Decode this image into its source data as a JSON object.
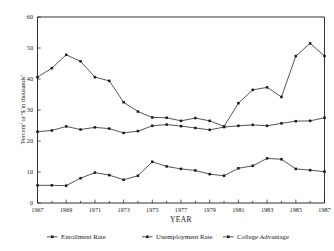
{
  "chart_data": {
    "type": "line",
    "title": "",
    "xlabel": "YEAR",
    "ylabel": "'Percent' or '$ in thousands'",
    "xlim": [
      1967,
      1987
    ],
    "ylim": [
      0,
      60
    ],
    "grid": false,
    "legend_position": "bottom",
    "x": [
      1967,
      1968,
      1969,
      1970,
      1971,
      1972,
      1973,
      1974,
      1975,
      1976,
      1977,
      1978,
      1979,
      1980,
      1981,
      1982,
      1983,
      1984,
      1985,
      1986,
      1987
    ],
    "xtick_labels": [
      "1967",
      "1969",
      "1971",
      "1973",
      "1975",
      "1977",
      "1979",
      "1981",
      "1983",
      "1985",
      "1987"
    ],
    "xtick_values": [
      1967,
      1969,
      1971,
      1973,
      1975,
      1977,
      1979,
      1981,
      1983,
      1985,
      1987
    ],
    "ytick_labels": [
      "0",
      "10",
      "20",
      "30",
      "40",
      "50",
      "60"
    ],
    "ytick_values": [
      0,
      10,
      20,
      30,
      40,
      50,
      60
    ],
    "series": [
      {
        "name": "Enrollment Rate",
        "marker": "square",
        "values": [
          23.0,
          23.4,
          24.7,
          23.7,
          24.4,
          24.0,
          22.6,
          23.2,
          24.9,
          25.3,
          24.8,
          24.2,
          23.6,
          24.5,
          24.9,
          25.2,
          24.9,
          25.7,
          26.4,
          26.5,
          27.5
        ]
      },
      {
        "name": "Unemployment Rate",
        "marker": "square",
        "values": [
          5.7,
          5.7,
          5.6,
          8.0,
          9.8,
          9.0,
          7.5,
          8.8,
          13.3,
          11.8,
          11.0,
          10.5,
          9.3,
          8.8,
          11.2,
          12.0,
          14.4,
          14.1,
          11.0,
          10.6,
          10.1
        ]
      },
      {
        "name": "College Advantage",
        "marker": "square",
        "values": [
          40.6,
          43.5,
          47.8,
          45.7,
          40.6,
          39.4,
          32.5,
          29.5,
          27.6,
          27.5,
          26.5,
          27.4,
          26.5,
          24.7,
          32.2,
          36.5,
          37.3,
          34.2,
          47.4,
          51.5,
          47.4
        ]
      }
    ]
  },
  "legend": {
    "items": [
      {
        "label": "Enrollment Rate"
      },
      {
        "label": "Unemployment Rate"
      },
      {
        "label": "College Advantage"
      }
    ]
  }
}
